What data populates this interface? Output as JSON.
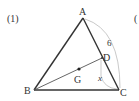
{
  "problem": {
    "number_label": "(1)",
    "next_label_partial": "("
  },
  "figure": {
    "type": "triangle",
    "vertices": {
      "A": {
        "label": "A",
        "x": 83,
        "y": 18
      },
      "B": {
        "label": "B",
        "x": 34,
        "y": 90
      },
      "C": {
        "label": "C",
        "x": 119,
        "y": 90
      }
    },
    "points": {
      "D": {
        "label": "D",
        "x": 102,
        "y": 58,
        "on": "AC"
      },
      "G": {
        "label": "G",
        "x": 79,
        "y": 69,
        "note": "centroid"
      }
    },
    "segments": [
      "AB",
      "BC",
      "CA",
      "BD"
    ],
    "measures": {
      "AC_length_label": "6",
      "DC_length_label": "x"
    },
    "colors": {
      "line": "#333333",
      "arc": "#b0b0b0",
      "text": "#333333"
    }
  }
}
